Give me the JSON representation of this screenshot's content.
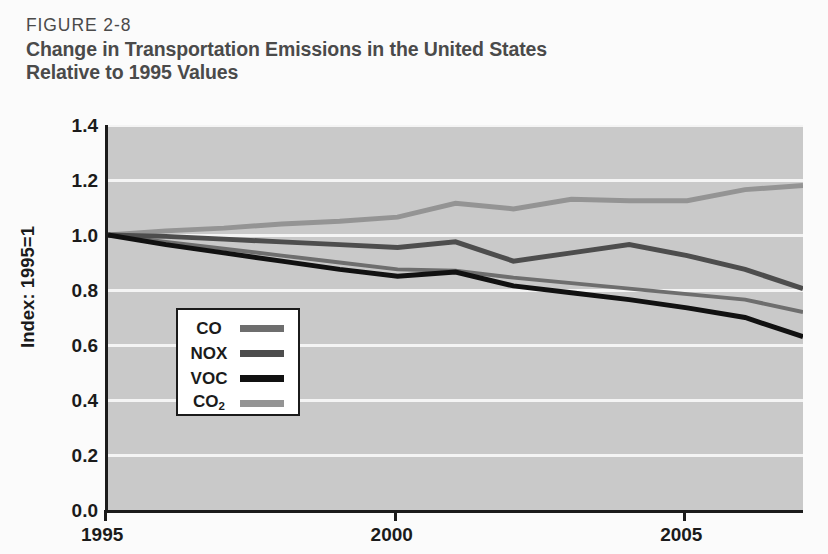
{
  "header": {
    "figure_number": "FIGURE 2-8",
    "title_line_1": "Change in Transportation Emissions in the United States",
    "title_line_2": "Relative to 1995 Values"
  },
  "colors": {
    "plot_background": "#c9c9c9",
    "gridline": "#f4f4f4",
    "axis": "#1b1b1b",
    "text": "#1b1b1b",
    "header_text": "#4a4a4a",
    "co": "#6e6e6e",
    "nox": "#4d4d4d",
    "voc": "#111111",
    "co2": "#949494"
  },
  "chart_data": {
    "type": "line",
    "title": "Change in Transportation Emissions in the United States Relative to 1995 Values",
    "subtitle": "FIGURE 2-8",
    "xlabel": "",
    "ylabel": "Index: 1995=1",
    "xlim": [
      1995,
      2007
    ],
    "ylim": [
      0.0,
      1.4
    ],
    "grid": true,
    "legend_position": "inside-left",
    "x": [
      1995,
      1996,
      1997,
      1998,
      1999,
      2000,
      2001,
      2002,
      2003,
      2004,
      2005,
      2006,
      2007
    ],
    "y_ticks": [
      0.0,
      0.2,
      0.4,
      0.6,
      0.8,
      1.0,
      1.2,
      1.4
    ],
    "y_tick_labels": [
      "0.0",
      "0.2",
      "0.4",
      "0.6",
      "0.8",
      "1.0",
      "1.2",
      "1.4"
    ],
    "x_ticks": [
      1995,
      2000,
      2005
    ],
    "x_tick_labels": [
      "1995",
      "2000",
      "2005"
    ],
    "series": [
      {
        "name": "CO",
        "color": "#6e6e6e",
        "width": 4,
        "values": [
          1.0,
          0.975,
          0.95,
          0.925,
          0.9,
          0.875,
          0.87,
          0.845,
          0.825,
          0.805,
          0.785,
          0.765,
          0.72
        ]
      },
      {
        "name": "NOX",
        "color": "#4d4d4d",
        "width": 5,
        "values": [
          1.0,
          0.995,
          0.985,
          0.975,
          0.965,
          0.955,
          0.975,
          0.905,
          0.935,
          0.965,
          0.925,
          0.875,
          0.805
        ]
      },
      {
        "name": "VOC",
        "color": "#111111",
        "width": 5,
        "values": [
          1.0,
          0.965,
          0.935,
          0.905,
          0.875,
          0.85,
          0.865,
          0.815,
          0.79,
          0.765,
          0.735,
          0.7,
          0.63
        ]
      },
      {
        "name": "CO2",
        "color": "#949494",
        "width": 5,
        "values": [
          1.0,
          1.015,
          1.025,
          1.04,
          1.05,
          1.065,
          1.115,
          1.095,
          1.13,
          1.125,
          1.125,
          1.165,
          1.18
        ]
      }
    ]
  },
  "legend": {
    "items": [
      {
        "label": "CO",
        "sub": "",
        "color": "#6e6e6e"
      },
      {
        "label": "NOX",
        "sub": "",
        "color": "#4d4d4d"
      },
      {
        "label": "VOC",
        "sub": "",
        "color": "#111111"
      },
      {
        "label": "CO",
        "sub": "2",
        "color": "#949494"
      }
    ]
  }
}
